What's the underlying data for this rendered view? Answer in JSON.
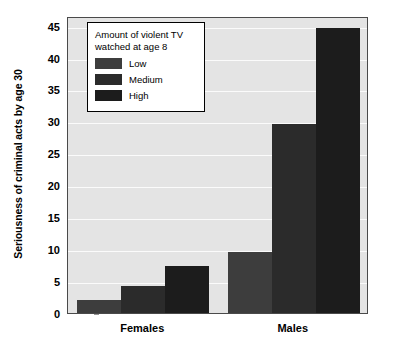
{
  "chart_data": {
    "type": "bar",
    "title": "",
    "xlabel": "",
    "ylabel": "Seriousness of criminal acts by age 30",
    "categories": [
      "Females",
      "Males"
    ],
    "series": [
      {
        "name": "Low",
        "values": [
          2.1,
          9.6
        ],
        "color": "#3d3d3d"
      },
      {
        "name": "Medium",
        "values": [
          4.2,
          29.6
        ],
        "color": "#2b2b2b"
      },
      {
        "name": "High",
        "values": [
          7.3,
          44.7
        ],
        "color": "#1c1c1c"
      }
    ],
    "ylim": [
      0,
      46.5
    ],
    "yticks": [
      0,
      5,
      10,
      15,
      20,
      25,
      30,
      35,
      40,
      45
    ],
    "ytick_labels": [
      "0",
      "5",
      "10",
      "15",
      "20",
      "25",
      "30",
      "35",
      "40",
      "45"
    ],
    "grid": true,
    "grid_color": "#fbfbfb",
    "plot_background": "#e4e4e4",
    "legend_position": "upper left",
    "legend_title": "Amount of violent TV\nwatched at age 8"
  },
  "legend": {
    "title": "Amount of violent TV\nwatched at age 8",
    "items": [
      {
        "label": "Low"
      },
      {
        "label": "Medium"
      },
      {
        "label": "High"
      }
    ]
  },
  "axes": {
    "y_title": "Seriousness of criminal acts by age 30",
    "x_labels": [
      "Females",
      "Males"
    ]
  }
}
